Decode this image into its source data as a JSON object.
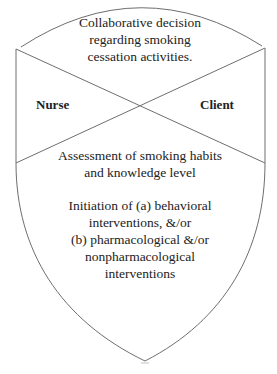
{
  "diagram": {
    "top_section": {
      "lines": [
        "Collaborative decision",
        "regarding smoking",
        "cessation activities."
      ]
    },
    "left_label": "Nurse",
    "right_label": "Client",
    "assessment": {
      "lines": [
        "Assessment of smoking habits",
        "and knowledge level"
      ]
    },
    "initiation": {
      "lines": [
        "Initiation of (a) behavioral",
        "interventions, &/or",
        "(b) pharmacological &/or",
        "nonpharmacological",
        "interventions"
      ]
    },
    "colors": {
      "stroke": "#6e6e6e",
      "text": "#222222",
      "background": "#ffffff"
    }
  }
}
